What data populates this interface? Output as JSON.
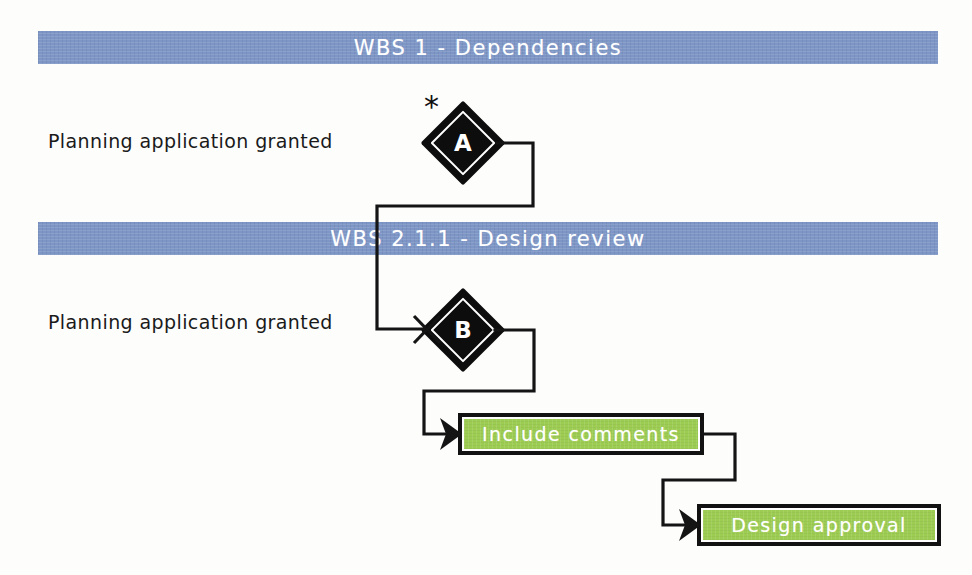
{
  "diagram": {
    "colors": {
      "banner_blue": "#7d96c6",
      "task_green": "#9dcc53",
      "ink_black": "#141414",
      "label_white": "#ffffff",
      "page_background": "#fdfdfc"
    }
  },
  "banners": [
    {
      "id": "wbs-1",
      "label": "WBS 1 - Dependencies"
    },
    {
      "id": "wbs-211",
      "label": "WBS 2.1.1 - Design review"
    }
  ],
  "row_labels": [
    {
      "id": "row-label-1",
      "text": "Planning application granted"
    },
    {
      "id": "row-label-2",
      "text": "Planning application granted"
    }
  ],
  "milestones": [
    {
      "id": "milestone-a",
      "letter": "A",
      "marker": "*",
      "marker_name": "asterisk-marker"
    },
    {
      "id": "milestone-b",
      "letter": "B",
      "marker": "",
      "marker_name": "none"
    }
  ],
  "tasks": [
    {
      "id": "task-include-comments",
      "label": "Include comments"
    },
    {
      "id": "task-design-approval",
      "label": "Design approval"
    }
  ],
  "connections": [
    {
      "id": "link-a-to-b",
      "from": "milestone-a",
      "to": "milestone-b"
    },
    {
      "id": "link-b-to-include-comments",
      "from": "milestone-b",
      "to": "task-include-comments"
    },
    {
      "id": "link-include-comments-to-design-approval",
      "from": "task-include-comments",
      "to": "task-design-approval"
    }
  ]
}
